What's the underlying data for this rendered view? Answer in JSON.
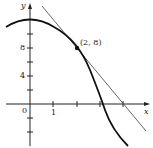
{
  "diagram": {
    "axes": {
      "x_label": "x",
      "y_label": "y"
    },
    "x_ticks": [
      {
        "value": 0,
        "label": "0"
      },
      {
        "value": 1,
        "label": "1"
      },
      {
        "value": 2,
        "label": ""
      },
      {
        "value": 3,
        "label": ""
      },
      {
        "value": 4,
        "label": ""
      }
    ],
    "y_ticks": [
      {
        "value": 8,
        "label": "8"
      },
      {
        "value": 4,
        "label": "4"
      }
    ],
    "point": {
      "label": "(2, 8)",
      "x": 2,
      "y": 8
    },
    "curve": "y = 12 - x^2",
    "tangent": "y = 16 - 4x",
    "colors": {
      "ink": "#222222",
      "tangent": "#555555"
    }
  }
}
